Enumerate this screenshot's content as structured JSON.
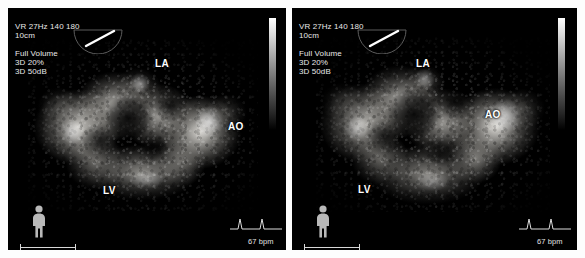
{
  "display": {
    "modality": "3D echocardiography volume rendering",
    "panel_count": 2,
    "background_color": "#000000",
    "text_color": "#e8e8e8",
    "annotation_color": "#ffffff"
  },
  "panels": [
    {
      "id": "left",
      "overlay": {
        "line1": "VR 27Hz 140 180",
        "line2": "10cm",
        "line3": "Full Volume",
        "line4": "3D 20%",
        "line5": "3D 50dB"
      },
      "annotations": [
        {
          "label": "LA",
          "name": "left-atrium"
        },
        {
          "label": "AO",
          "name": "aorta"
        },
        {
          "label": "LV",
          "name": "left-ventricle"
        }
      ],
      "body_marker": "standing-body-icon",
      "heart_rate": "67 bpm",
      "ecg": "ecg-trace-icon",
      "gray_bar": "grayscale-reference-bar"
    },
    {
      "id": "right",
      "overlay": {
        "line1": "VR 27Hz 140 180",
        "line2": "10cm",
        "line3": "Full Volume",
        "line4": "3D 20%",
        "line5": "3D 50dB"
      },
      "annotations": [
        {
          "label": "LA",
          "name": "left-atrium"
        },
        {
          "label": "AO",
          "name": "aorta"
        },
        {
          "label": "LV",
          "name": "left-ventricle"
        }
      ],
      "body_marker": "standing-body-icon",
      "heart_rate": "67 bpm",
      "ecg": "ecg-trace-icon",
      "gray_bar": "grayscale-reference-bar"
    }
  ]
}
